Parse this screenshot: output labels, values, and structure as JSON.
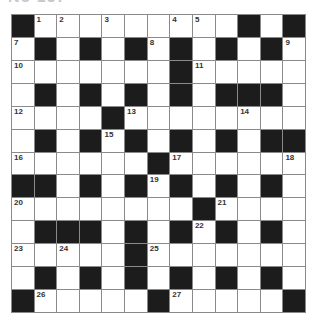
{
  "puzzle": {
    "title": "No 137",
    "rows": 13,
    "cols": 13,
    "layout": [
      "#.........#.#",
      ".#.#.#.#.#.#.",
      ".......#.....",
      ".#.#.#.#.###.",
      "....#........",
      ".#.#.#.#.#.##",
      "......#......",
      "##.#.#.#.#.#.",
      "........#....",
      ".###.#.#.#.#.",
      ".....#.......",
      ".#.#.#.#.#.#.",
      "#.....#.....#"
    ],
    "numbers": [
      {
        "r": 0,
        "c": 1,
        "n": "1"
      },
      {
        "r": 0,
        "c": 2,
        "n": "2"
      },
      {
        "r": 0,
        "c": 4,
        "n": "3"
      },
      {
        "r": 0,
        "c": 7,
        "n": "4"
      },
      {
        "r": 0,
        "c": 8,
        "n": "5"
      },
      {
        "r": 0,
        "c": 10,
        "n": "6"
      },
      {
        "r": 1,
        "c": 0,
        "n": "7"
      },
      {
        "r": 1,
        "c": 6,
        "n": "8"
      },
      {
        "r": 1,
        "c": 12,
        "n": "9"
      },
      {
        "r": 2,
        "c": 0,
        "n": "10"
      },
      {
        "r": 2,
        "c": 8,
        "n": "11"
      },
      {
        "r": 4,
        "c": 0,
        "n": "12"
      },
      {
        "r": 4,
        "c": 5,
        "n": "13"
      },
      {
        "r": 4,
        "c": 10,
        "n": "14"
      },
      {
        "r": 5,
        "c": 4,
        "n": "15"
      },
      {
        "r": 6,
        "c": 0,
        "n": "16"
      },
      {
        "r": 6,
        "c": 7,
        "n": "17"
      },
      {
        "r": 6,
        "c": 12,
        "n": "18"
      },
      {
        "r": 7,
        "c": 6,
        "n": "19"
      },
      {
        "r": 8,
        "c": 0,
        "n": "20"
      },
      {
        "r": 8,
        "c": 9,
        "n": "21"
      },
      {
        "r": 9,
        "c": 8,
        "n": "22"
      },
      {
        "r": 10,
        "c": 0,
        "n": "23"
      },
      {
        "r": 10,
        "c": 2,
        "n": "24"
      },
      {
        "r": 10,
        "c": 6,
        "n": "25"
      },
      {
        "r": 12,
        "c": 1,
        "n": "26"
      },
      {
        "r": 12,
        "c": 7,
        "n": "27"
      }
    ]
  }
}
